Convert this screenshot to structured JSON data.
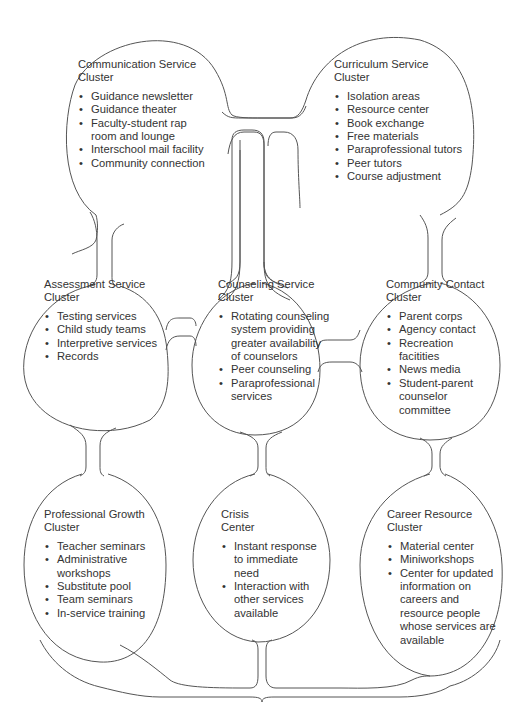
{
  "diagram": {
    "stroke_color": "#555555",
    "text_color": "#333333",
    "clusters": [
      {
        "id": "communication",
        "title_line1": "Communication Service",
        "title_line2": "Cluster",
        "items": [
          "Guidance newsletter",
          "Guidance theater",
          "Faculty-student rap room and lounge",
          "Interschool mail facility",
          "Community connection"
        ]
      },
      {
        "id": "curriculum",
        "title_line1": "Curriculum Service",
        "title_line2": "Cluster",
        "items": [
          "Isolation areas",
          "Resource center",
          "Book exchange",
          "Free materials",
          "Paraprofessional tutors",
          "Peer tutors",
          "Course adjustment"
        ]
      },
      {
        "id": "assessment",
        "title_line1": "Assessment Service",
        "title_line2": "Cluster",
        "items": [
          "Testing services",
          "Child study teams",
          "Interpretive services",
          "Records"
        ]
      },
      {
        "id": "counseling",
        "title_line1": "Counseling Service",
        "title_line2": "Cluster",
        "items": [
          "Rotating counseling system providing greater availability of counselors",
          "Peer counseling",
          "Paraprofessional services"
        ]
      },
      {
        "id": "community-contact",
        "title_line1": "Community Contact",
        "title_line2": "Cluster",
        "items": [
          "Parent corps",
          "Agency contact",
          "Recreation facitities",
          "News media",
          "Student-parent counselor committee"
        ]
      },
      {
        "id": "professional-growth",
        "title_line1": "Professional Growth",
        "title_line2": "Cluster",
        "items": [
          "Teacher seminars",
          "Administrative workshops",
          "Substitute pool",
          "Team seminars",
          "In-service training"
        ]
      },
      {
        "id": "crisis",
        "title_line1": "Crisis",
        "title_line2": "Center",
        "items": [
          "Instant response to immediate need",
          "Interaction with other services available"
        ]
      },
      {
        "id": "career-resource",
        "title_line1": "Career Resource",
        "title_line2": "Cluster",
        "items": [
          "Material center",
          "Miniworkshops",
          "Center for updated information on careers and resource people whose services are available"
        ]
      }
    ]
  }
}
